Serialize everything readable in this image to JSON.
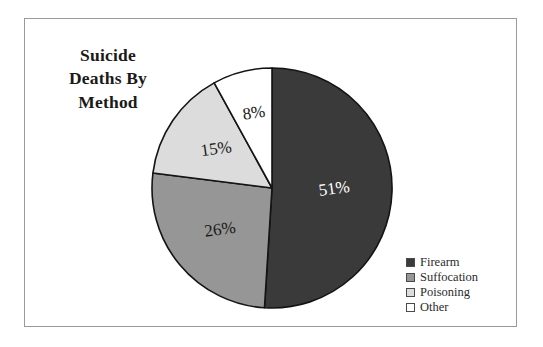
{
  "figure": {
    "background_color": "#ffffff",
    "frame_color": "#9a9a9a"
  },
  "title": {
    "line1": "Suicide",
    "line2": "Deaths By",
    "line3": "Method",
    "full": "Suicide Deaths By Method"
  },
  "legend": {
    "position": "bottom-right",
    "items": [
      {
        "label": "Firearm",
        "color": "#3a3a3a"
      },
      {
        "label": "Suffocation",
        "color": "#969696"
      },
      {
        "label": "Poisoning",
        "color": "#dcdcdc"
      },
      {
        "label": "Other",
        "color": "#ffffff"
      }
    ]
  },
  "chart_data": {
    "type": "pie",
    "title": "Suicide Deaths By Method",
    "xlabel": "",
    "ylabel": "",
    "categories": [
      "Firearm",
      "Suffocation",
      "Poisoning",
      "Other"
    ],
    "values": [
      51,
      26,
      15,
      8
    ],
    "unit": "%",
    "data_labels": [
      "51%",
      "26%",
      "15%",
      "8%"
    ],
    "colors": [
      "#3a3a3a",
      "#969696",
      "#dcdcdc",
      "#ffffff"
    ],
    "label_text_colors": [
      "#ffffff",
      "#1a1a1a",
      "#1a1a1a",
      "#1a1a1a"
    ],
    "start_angle_deg": 0,
    "direction": "clockwise",
    "legend_position": "bottom-right",
    "grid": false,
    "slice_outline_color": "#141414"
  }
}
